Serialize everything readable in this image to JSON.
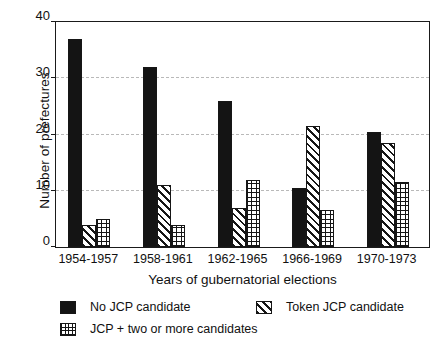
{
  "chart_data": {
    "type": "bar",
    "title": "",
    "xlabel": "Years of gubernatorial elections",
    "ylabel": "Number of prefectures",
    "ylim": [
      0,
      40
    ],
    "yticks": [
      0,
      10,
      20,
      30,
      40
    ],
    "grid": "horizontal-dashed",
    "legend_position": "below-axes",
    "categories": [
      "1954-1957",
      "1958-1961",
      "1962-1965",
      "1966-1969",
      "1970-1973"
    ],
    "series": [
      {
        "name": "No JCP candidate",
        "pattern": "solid-black",
        "values": [
          37,
          32,
          26,
          10.5,
          20.5
        ]
      },
      {
        "name": "Token JCP candidate",
        "pattern": "diagonal-hatch",
        "values": [
          4,
          11,
          7,
          21.5,
          18.5
        ]
      },
      {
        "name": "JCP + two or more candidates",
        "pattern": "cross-hatch",
        "values": [
          5,
          4,
          12,
          6.5,
          11.5
        ]
      }
    ]
  },
  "axes": {
    "ytick_labels": [
      "0",
      "10",
      "20",
      "30",
      "40"
    ],
    "xtick_labels": [
      "1954-1957",
      "1958-1961",
      "1962-1965",
      "1966-1969",
      "1970-1973"
    ],
    "ylabel": "Number of prefectures",
    "xlabel": "Years of gubernatorial elections"
  },
  "legend": {
    "entries": [
      {
        "label": "No JCP candidate",
        "swatch": "solid-swatch"
      },
      {
        "label": "Token JCP candidate",
        "swatch": "hatch-swatch"
      },
      {
        "label": "JCP + two or more candidates",
        "swatch": "cross-swatch"
      }
    ]
  }
}
